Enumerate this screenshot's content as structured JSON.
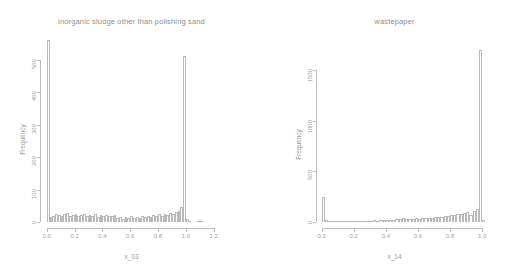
{
  "chart_data": [
    {
      "type": "bar",
      "title": "inorganic sludge other than polishing sand",
      "xlabel": "x_03",
      "ylabel": "Frequency",
      "xlim": [
        -0.02,
        1.26
      ],
      "ylim": [
        0,
        560
      ],
      "xticks": [
        "0.0",
        "0.2",
        "0.4",
        "0.6",
        "0.8",
        "1.0",
        "1.2"
      ],
      "xtickvals": [
        0.0,
        0.2,
        0.4,
        0.6,
        0.8,
        1.0,
        1.2
      ],
      "yticks": [
        "0",
        "100",
        "200",
        "300",
        "400",
        "500"
      ],
      "ytickvals": [
        0,
        100,
        200,
        300,
        400,
        500
      ],
      "grid": false,
      "legend": "none",
      "binwidth": 0.02,
      "bins": [
        {
          "x": 0.0,
          "value": 560
        },
        {
          "x": 0.02,
          "value": 14
        },
        {
          "x": 0.04,
          "value": 20
        },
        {
          "x": 0.06,
          "value": 26
        },
        {
          "x": 0.08,
          "value": 22
        },
        {
          "x": 0.1,
          "value": 19
        },
        {
          "x": 0.12,
          "value": 24
        },
        {
          "x": 0.14,
          "value": 27
        },
        {
          "x": 0.16,
          "value": 20
        },
        {
          "x": 0.18,
          "value": 22
        },
        {
          "x": 0.2,
          "value": 25
        },
        {
          "x": 0.22,
          "value": 18
        },
        {
          "x": 0.24,
          "value": 21
        },
        {
          "x": 0.26,
          "value": 26
        },
        {
          "x": 0.28,
          "value": 17
        },
        {
          "x": 0.3,
          "value": 22
        },
        {
          "x": 0.32,
          "value": 20
        },
        {
          "x": 0.34,
          "value": 24
        },
        {
          "x": 0.36,
          "value": 16
        },
        {
          "x": 0.38,
          "value": 21
        },
        {
          "x": 0.4,
          "value": 19
        },
        {
          "x": 0.42,
          "value": 23
        },
        {
          "x": 0.44,
          "value": 18
        },
        {
          "x": 0.46,
          "value": 20
        },
        {
          "x": 0.48,
          "value": 22
        },
        {
          "x": 0.5,
          "value": 12
        },
        {
          "x": 0.52,
          "value": 14
        },
        {
          "x": 0.54,
          "value": 10
        },
        {
          "x": 0.56,
          "value": 16
        },
        {
          "x": 0.58,
          "value": 13
        },
        {
          "x": 0.6,
          "value": 18
        },
        {
          "x": 0.62,
          "value": 12
        },
        {
          "x": 0.64,
          "value": 15
        },
        {
          "x": 0.66,
          "value": 11
        },
        {
          "x": 0.68,
          "value": 17
        },
        {
          "x": 0.7,
          "value": 14
        },
        {
          "x": 0.72,
          "value": 20
        },
        {
          "x": 0.74,
          "value": 16
        },
        {
          "x": 0.76,
          "value": 22
        },
        {
          "x": 0.78,
          "value": 18
        },
        {
          "x": 0.8,
          "value": 24
        },
        {
          "x": 0.82,
          "value": 19
        },
        {
          "x": 0.84,
          "value": 26
        },
        {
          "x": 0.86,
          "value": 21
        },
        {
          "x": 0.88,
          "value": 28
        },
        {
          "x": 0.9,
          "value": 24
        },
        {
          "x": 0.92,
          "value": 30
        },
        {
          "x": 0.94,
          "value": 34
        },
        {
          "x": 0.96,
          "value": 46
        },
        {
          "x": 0.98,
          "value": 510
        },
        {
          "x": 1.0,
          "value": 8
        },
        {
          "x": 1.02,
          "value": 3
        },
        {
          "x": 1.04,
          "value": 0
        },
        {
          "x": 1.06,
          "value": 0
        },
        {
          "x": 1.08,
          "value": 2
        },
        {
          "x": 1.1,
          "value": 2
        },
        {
          "x": 1.12,
          "value": 0
        },
        {
          "x": 1.14,
          "value": 0
        },
        {
          "x": 1.16,
          "value": 0
        },
        {
          "x": 1.18,
          "value": 0
        },
        {
          "x": 1.2,
          "value": 0
        },
        {
          "x": 1.22,
          "value": 0
        }
      ]
    },
    {
      "type": "bar",
      "title": "wastepaper",
      "xlabel": "x_14",
      "ylabel": "Frequency",
      "xlim": [
        -0.01,
        1.03
      ],
      "ylim": [
        0,
        1800
      ],
      "xticks": [
        "0.0",
        "0.2",
        "0.4",
        "0.6",
        "0.8",
        "1.0"
      ],
      "xtickvals": [
        0.0,
        0.2,
        0.4,
        0.6,
        0.8,
        1.0
      ],
      "yticks": [
        "0",
        "500",
        "1000",
        "1500"
      ],
      "ytickvals": [
        0,
        500,
        1000,
        1500
      ],
      "grid": false,
      "legend": "none",
      "binwidth": 0.02,
      "bins": [
        {
          "x": 0.0,
          "value": 250
        },
        {
          "x": 0.02,
          "value": 18
        },
        {
          "x": 0.04,
          "value": 14
        },
        {
          "x": 0.06,
          "value": 12
        },
        {
          "x": 0.08,
          "value": 13
        },
        {
          "x": 0.1,
          "value": 11
        },
        {
          "x": 0.12,
          "value": 12
        },
        {
          "x": 0.14,
          "value": 10
        },
        {
          "x": 0.16,
          "value": 13
        },
        {
          "x": 0.18,
          "value": 11
        },
        {
          "x": 0.2,
          "value": 12
        },
        {
          "x": 0.22,
          "value": 10
        },
        {
          "x": 0.24,
          "value": 14
        },
        {
          "x": 0.26,
          "value": 12
        },
        {
          "x": 0.28,
          "value": 13
        },
        {
          "x": 0.3,
          "value": 11
        },
        {
          "x": 0.32,
          "value": 15
        },
        {
          "x": 0.34,
          "value": 13
        },
        {
          "x": 0.36,
          "value": 16
        },
        {
          "x": 0.38,
          "value": 18
        },
        {
          "x": 0.4,
          "value": 20
        },
        {
          "x": 0.42,
          "value": 22
        },
        {
          "x": 0.44,
          "value": 24
        },
        {
          "x": 0.46,
          "value": 26
        },
        {
          "x": 0.48,
          "value": 30
        },
        {
          "x": 0.5,
          "value": 36
        },
        {
          "x": 0.52,
          "value": 34
        },
        {
          "x": 0.54,
          "value": 30
        },
        {
          "x": 0.56,
          "value": 32
        },
        {
          "x": 0.58,
          "value": 36
        },
        {
          "x": 0.6,
          "value": 34
        },
        {
          "x": 0.62,
          "value": 38
        },
        {
          "x": 0.64,
          "value": 40
        },
        {
          "x": 0.66,
          "value": 42
        },
        {
          "x": 0.68,
          "value": 44
        },
        {
          "x": 0.7,
          "value": 46
        },
        {
          "x": 0.72,
          "value": 50
        },
        {
          "x": 0.74,
          "value": 54
        },
        {
          "x": 0.76,
          "value": 58
        },
        {
          "x": 0.78,
          "value": 62
        },
        {
          "x": 0.8,
          "value": 66
        },
        {
          "x": 0.82,
          "value": 72
        },
        {
          "x": 0.84,
          "value": 80
        },
        {
          "x": 0.86,
          "value": 76
        },
        {
          "x": 0.88,
          "value": 88
        },
        {
          "x": 0.9,
          "value": 96
        },
        {
          "x": 0.92,
          "value": 70
        },
        {
          "x": 0.94,
          "value": 110
        },
        {
          "x": 0.96,
          "value": 130
        },
        {
          "x": 0.98,
          "value": 1700
        },
        {
          "x": 1.0,
          "value": 20
        }
      ]
    }
  ]
}
